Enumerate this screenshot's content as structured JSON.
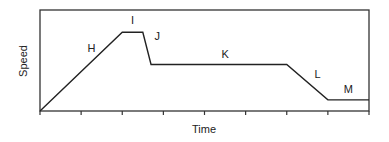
{
  "chart_data": {
    "type": "line",
    "title": "",
    "xlabel": "Time",
    "ylabel": "Speed",
    "xlim": [
      0,
      8
    ],
    "ylim": [
      0,
      1
    ],
    "x_ticks": [
      0,
      1,
      2,
      3,
      4,
      5,
      6,
      7,
      8
    ],
    "x_tick_labels": [],
    "y_ticks": [],
    "grid": false,
    "legend": null,
    "series": [
      {
        "name": "speed",
        "points": [
          {
            "x": 0,
            "y": 0
          },
          {
            "x": 2,
            "y": 0.78
          },
          {
            "x": 2.5,
            "y": 0.78
          },
          {
            "x": 2.7,
            "y": 0.46
          },
          {
            "x": 6,
            "y": 0.46
          },
          {
            "x": 7,
            "y": 0.11
          },
          {
            "x": 8,
            "y": 0.11
          }
        ]
      }
    ],
    "annotations": [
      {
        "text": "H",
        "x": 1.25,
        "y": 0.58
      },
      {
        "text": "I",
        "x": 2.25,
        "y": 0.86
      },
      {
        "text": "J",
        "x": 2.85,
        "y": 0.7
      },
      {
        "text": "K",
        "x": 4.5,
        "y": 0.52
      },
      {
        "text": "L",
        "x": 6.75,
        "y": 0.33
      },
      {
        "text": "M",
        "x": 7.5,
        "y": 0.18
      }
    ]
  }
}
